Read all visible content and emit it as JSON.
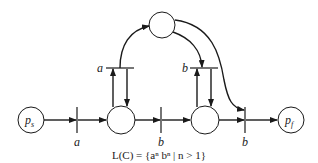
{
  "diagram": {
    "type": "petri-net",
    "places": [
      {
        "id": "ps",
        "label_main": "p",
        "label_sub": "s"
      },
      {
        "id": "p1",
        "label_main": "",
        "label_sub": ""
      },
      {
        "id": "p2",
        "label_main": "",
        "label_sub": ""
      },
      {
        "id": "ptop",
        "label_main": "",
        "label_sub": ""
      },
      {
        "id": "pf",
        "label_main": "p",
        "label_sub": "f"
      }
    ],
    "transitions": [
      {
        "id": "t1",
        "label": "a"
      },
      {
        "id": "t2",
        "label": "b"
      },
      {
        "id": "t3",
        "label": "b"
      },
      {
        "id": "t_loop_a",
        "label": "a"
      },
      {
        "id": "t_loop_b",
        "label": "b"
      }
    ],
    "caption": "L(C) = {aⁿ bⁿ | n > 1}"
  }
}
